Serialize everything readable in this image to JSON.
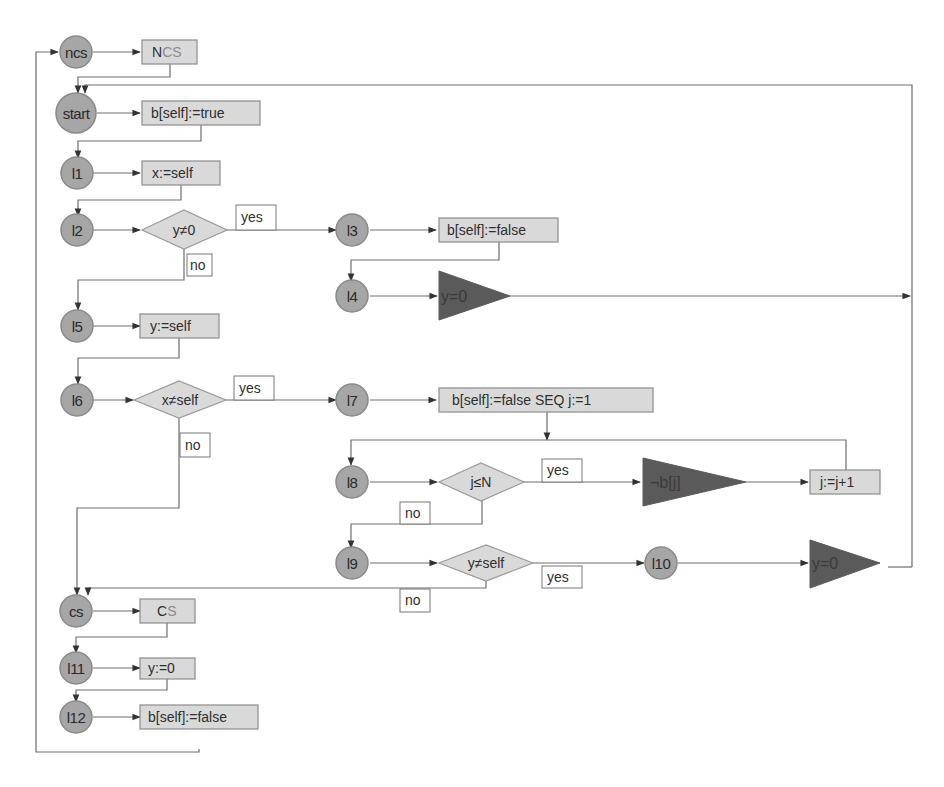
{
  "diagram": {
    "type": "flowchart",
    "colors": {
      "node_fill": "#a6a6a6",
      "box_fill": "#d9d9d9",
      "triangle_fill": "#5a5a5a",
      "edge": "#6e6e6e"
    },
    "states": {
      "ncs": "ncs",
      "start": "start",
      "l1": "l1",
      "l2": "l2",
      "l3": "l3",
      "l4": "l4",
      "l5": "l5",
      "l6": "l6",
      "l7": "l7",
      "l8": "l8",
      "l9": "l9",
      "l10": "l10",
      "cs": "cs",
      "l11": "l11",
      "l12": "l12"
    },
    "actions": {
      "ncs_main": "N",
      "ncs_sub": "CS",
      "start": "b[self]:=true",
      "l1": "x:=self",
      "l3": "b[self]:=false",
      "l5": "y:=self",
      "l7": "b[self]:=false SEQ j:=1",
      "l8_inc": "j:=j+1",
      "cs_main": "C",
      "cs_sub": "S",
      "l11": "y:=0",
      "l12": "b[self]:=false"
    },
    "conditions": {
      "l2": "y≠0",
      "l6": "x≠self",
      "l8": "j≤N",
      "l9": "y≠self"
    },
    "awaits": {
      "l4": "y=0",
      "l8": "¬b[j]",
      "l10": "y=0"
    },
    "edge_labels": {
      "yes": "yes",
      "no": "no"
    }
  }
}
